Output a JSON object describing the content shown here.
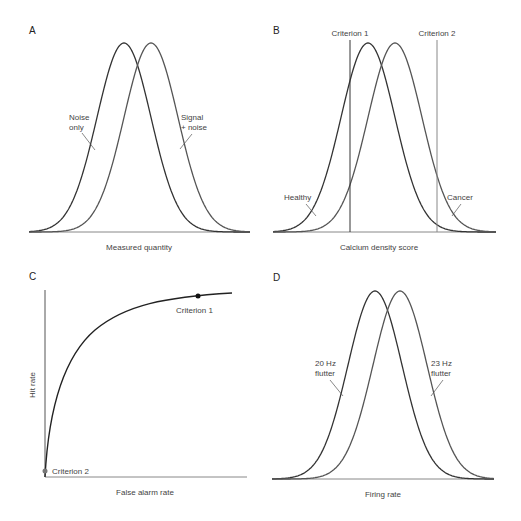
{
  "figure": {
    "panels": [
      {
        "id": "A",
        "xlabel": "Measured quantity",
        "labels": [
          "Noise",
          "only",
          "Signal",
          "+ noise"
        ]
      },
      {
        "id": "B",
        "xlabel": "Calcium density score",
        "labels": [
          "Healthy",
          "Cancer"
        ],
        "criteria": [
          "Criterion 1",
          "Criterion 2"
        ]
      },
      {
        "id": "C",
        "xlabel": "False alarm rate",
        "ylabel": "Hit rate",
        "points": [
          "Criterion 1",
          "Criterion 2"
        ]
      },
      {
        "id": "D",
        "xlabel": "Firing rate",
        "labels": [
          "20 Hz",
          "flutter",
          "23 Hz",
          "flutter"
        ]
      }
    ]
  },
  "colors": {
    "dark_curve": "#333333",
    "light_curve": "#666666",
    "axis": "#888888",
    "text": "#444444"
  },
  "chart_data": [
    {
      "panel": "A",
      "type": "line",
      "title": "",
      "xlabel": "Measured quantity",
      "ylabel": "",
      "series": [
        {
          "name": "Noise only",
          "distribution": "gaussian",
          "mean": 0.0,
          "sd": 1.0
        },
        {
          "name": "Signal + noise",
          "distribution": "gaussian",
          "mean": 0.75,
          "sd": 1.0
        }
      ],
      "grid": false,
      "ticks": false
    },
    {
      "panel": "B",
      "type": "line",
      "title": "",
      "xlabel": "Calcium density score",
      "ylabel": "",
      "series": [
        {
          "name": "Healthy",
          "distribution": "gaussian",
          "mean": 0.0,
          "sd": 1.0
        },
        {
          "name": "Cancer",
          "distribution": "gaussian",
          "mean": 0.75,
          "sd": 1.0
        }
      ],
      "annotations": [
        {
          "type": "vline",
          "label": "Criterion 1",
          "x": -0.5
        },
        {
          "type": "vline",
          "label": "Criterion 2",
          "x": 1.9
        }
      ],
      "grid": false,
      "ticks": false
    },
    {
      "panel": "C",
      "type": "line",
      "title": "ROC curve",
      "xlabel": "False alarm rate",
      "ylabel": "Hit rate",
      "series": [
        {
          "name": "ROC",
          "x": [
            0,
            0.05,
            0.1,
            0.2,
            0.3,
            0.4,
            0.5,
            0.6,
            0.7,
            0.8,
            0.9,
            0.95
          ],
          "y": [
            0,
            0.28,
            0.42,
            0.6,
            0.72,
            0.81,
            0.88,
            0.93,
            0.96,
            0.98,
            0.99,
            0.995
          ]
        }
      ],
      "points": [
        {
          "label": "Criterion 1",
          "x": 0.76,
          "y": 0.98
        },
        {
          "label": "Criterion 2",
          "x": 0.0,
          "y": 0.03
        }
      ],
      "xlim": [
        0,
        1
      ],
      "ylim": [
        0,
        1
      ],
      "grid": false,
      "ticks": false
    },
    {
      "panel": "D",
      "type": "line",
      "title": "",
      "xlabel": "Firing rate",
      "ylabel": "",
      "series": [
        {
          "name": "20 Hz flutter",
          "distribution": "gaussian",
          "mean": 0.0,
          "sd": 1.0
        },
        {
          "name": "23 Hz flutter",
          "distribution": "gaussian",
          "mean": 0.75,
          "sd": 1.0
        }
      ],
      "grid": false,
      "ticks": false
    }
  ]
}
